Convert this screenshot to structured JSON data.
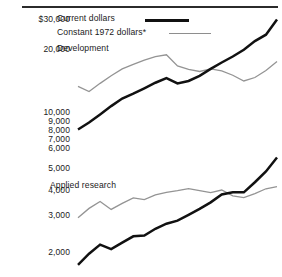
{
  "chart_data": {
    "type": "line",
    "title": "",
    "subtitle": "",
    "xlabel": "",
    "ylabel": "",
    "yscale": "log",
    "ylim": [
      1700,
      34000
    ],
    "grid": false,
    "legend_position": "top-left",
    "axis_tick_labels": [
      "$30,000",
      "20,000",
      "10,000",
      "9,000",
      "8,000",
      "7,000",
      "6,000",
      "5,000",
      "4,000",
      "3,000",
      "2,000"
    ],
    "axis_tick_values": [
      30000,
      20000,
      10000,
      9000,
      8000,
      7000,
      6000,
      5000,
      4000,
      3000,
      2000
    ],
    "legend": [
      {
        "name": "Current dollars",
        "style": "thick-black-line",
        "color": "#111111"
      },
      {
        "name": "Constant 1972 dollars*",
        "style": "thin-gray-line",
        "color": "#949494"
      }
    ],
    "group_labels": [
      "Development",
      "Applied research"
    ],
    "x": [
      1960,
      1961,
      1962,
      1963,
      1964,
      1965,
      1966,
      1967,
      1968,
      1969,
      1970,
      1971,
      1972,
      1973,
      1974,
      1975,
      1976,
      1977,
      1978
    ],
    "series": [
      {
        "name": "Development — Current dollars",
        "group": "Development",
        "dollars": "current",
        "color": "#111111",
        "values": [
          8300,
          9000,
          9900,
          10900,
          11900,
          12600,
          13400,
          14300,
          15100,
          14200,
          14600,
          15500,
          16800,
          18100,
          19400,
          21000,
          23200,
          25000,
          29800
        ]
      },
      {
        "name": "Development — Constant 1972 dollars*",
        "group": "Development",
        "dollars": "constant",
        "color": "#949494",
        "values": [
          13700,
          12900,
          14200,
          15500,
          16800,
          17700,
          18600,
          19400,
          19800,
          17400,
          16700,
          16300,
          16800,
          16400,
          15600,
          14600,
          15200,
          16500,
          18300
        ]
      },
      {
        "name": "Applied research — Current dollars",
        "group": "Applied research",
        "dollars": "current",
        "color": "#111111",
        "values": [
          1720,
          1960,
          2180,
          2070,
          2230,
          2400,
          2420,
          2620,
          2780,
          2880,
          3080,
          3300,
          3560,
          3900,
          4000,
          4000,
          4500,
          5100,
          6000
        ]
      },
      {
        "name": "Applied research — Constant 1972 dollars*",
        "group": "Applied research",
        "dollars": "constant",
        "color": "#949494",
        "values": [
          2980,
          3320,
          3600,
          3280,
          3520,
          3750,
          3680,
          3880,
          4000,
          4080,
          4180,
          4080,
          3990,
          4110,
          3840,
          3760,
          3940,
          4170,
          4280
        ]
      }
    ],
    "annotations": [
      "* footnote marker on Constant 1972 dollars legend entry"
    ]
  }
}
